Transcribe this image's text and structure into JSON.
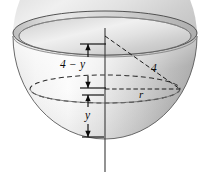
{
  "figure": {
    "labels": {
      "height_above_cross_section": "4 − y",
      "slant_radius": "4",
      "cross_section_radius": "r",
      "depth_below_cross_section": "y"
    },
    "colors": {
      "background": "#ffffff",
      "outline": "#3f3f3f",
      "ink": "#0b0b0b",
      "shell_light": "#fcfcfc",
      "shell_mid": "#d8d8d8",
      "shell_dark": "#a9a9a9",
      "interior_light": "#f2f2f2",
      "interior_mid": "#d2d2d2",
      "rim_band": "#c9c9c9"
    },
    "geometry": {
      "axis_x": 105,
      "axis_top_y": 7,
      "axis_bottom_y": 172,
      "rim_center_y": 36,
      "rim_rx": 92,
      "rim_ry": 21,
      "bowl_bottom_y": 139,
      "cross_section_center_y": 89,
      "cross_section_rx": 75,
      "cross_section_ry": 14,
      "slant_line_from": [
        105,
        36
      ],
      "slant_line_to": [
        180,
        89
      ],
      "measure_upper_x": 88,
      "measure_upper_top_y": 44,
      "measure_upper_bottom_y": 88,
      "measure_lower_x": 88,
      "measure_lower_top_y": 95,
      "measure_lower_bottom_y": 137
    }
  }
}
